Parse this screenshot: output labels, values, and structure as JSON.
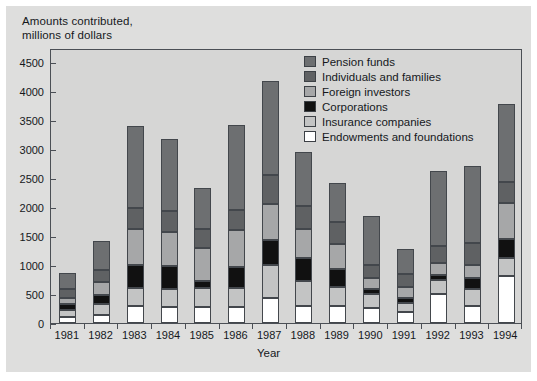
{
  "axis_title_y": "Amounts contributed,\nmillions of dollars",
  "axis_title_x": "Year",
  "legend": {
    "items": [
      {
        "label": "Pension funds",
        "color": "#6d6f71"
      },
      {
        "label": "Individuals and families",
        "color": "#5f6163"
      },
      {
        "label": "Foreign investors",
        "color": "#a6a7a8"
      },
      {
        "label": "Corporations",
        "color": "#111111"
      },
      {
        "label": "Insurance companies",
        "color": "#c3c4c4"
      },
      {
        "label": "Endowments and foundations",
        "color": "#ffffff"
      }
    ]
  },
  "colors": {
    "page_background": "#dededd",
    "plot_background": "#d6d6d5",
    "axis_line": "#4b4f55",
    "text": "#15181c"
  },
  "chart_data": {
    "type": "bar",
    "stacked": true,
    "title": "",
    "xlabel": "Year",
    "ylabel": "Amounts contributed, millions of dollars",
    "ylim": [
      0,
      4750
    ],
    "yticks": [
      0,
      500,
      1000,
      1500,
      2000,
      2500,
      3000,
      3500,
      4000,
      4500
    ],
    "ytick_labels": [
      "0",
      "500",
      "1000",
      "1500",
      "2000",
      "2500",
      "3000",
      "3500",
      "4000",
      "4500"
    ],
    "grid": false,
    "legend_position": "top-right-inside",
    "categories": [
      "1981",
      "1982",
      "1983",
      "1984",
      "1985",
      "1986",
      "1987",
      "1988",
      "1989",
      "1990",
      "1991",
      "1992",
      "1993",
      "1994"
    ],
    "series": [
      {
        "name": "Endowments and foundations",
        "color": "#ffffff",
        "values": [
          100,
          130,
          300,
          280,
          270,
          280,
          440,
          300,
          300,
          260,
          190,
          500,
          300,
          820
        ]
      },
      {
        "name": "Insurance companies",
        "color": "#c3c4c4",
        "values": [
          120,
          200,
          300,
          300,
          330,
          330,
          560,
          420,
          330,
          240,
          160,
          240,
          280,
          300
        ]
      },
      {
        "name": "Corporations",
        "color": "#111111",
        "values": [
          110,
          160,
          400,
          400,
          120,
          360,
          440,
          400,
          300,
          80,
          80,
          90,
          190,
          330
        ]
      },
      {
        "name": "Foreign investors",
        "color": "#a6a7a8",
        "values": [
          110,
          210,
          620,
          600,
          580,
          640,
          620,
          500,
          440,
          200,
          190,
          200,
          230,
          620
        ]
      },
      {
        "name": "Individuals and families",
        "color": "#5f6163",
        "values": [
          140,
          220,
          360,
          350,
          330,
          340,
          500,
          400,
          380,
          230,
          230,
          300,
          380,
          360
        ]
      },
      {
        "name": "Pension funds",
        "color": "#6d6f71",
        "values": [
          280,
          500,
          1430,
          1240,
          700,
          1470,
          1620,
          940,
          670,
          830,
          430,
          1290,
          1340,
          1350
        ]
      }
    ],
    "totals": [
      860,
      1420,
      3410,
      3170,
      2330,
      3420,
      4180,
      2960,
      2420,
      1840,
      1280,
      2620,
      2720,
      3780
    ]
  }
}
